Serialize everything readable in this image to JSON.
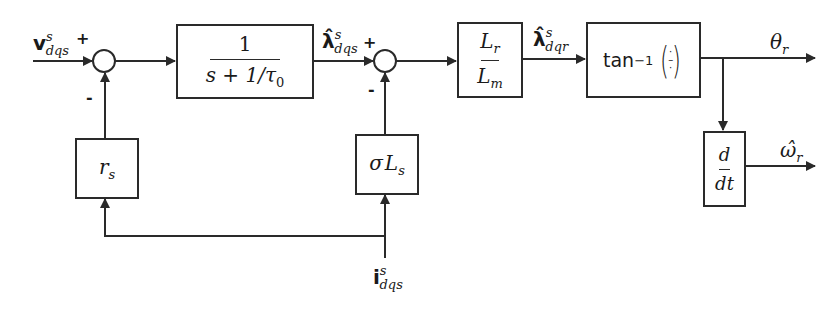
{
  "diagram": {
    "title": "",
    "type": "block-diagram",
    "inputs": {
      "voltage": {
        "symbol": "v",
        "sup": "s",
        "sub": "dqs",
        "sign": "+"
      },
      "current": {
        "symbol": "i",
        "sup": "s",
        "sub": "dqs"
      }
    },
    "summers": [
      {
        "id": "sum1",
        "plus_sign": "+",
        "minus_sign": "-"
      },
      {
        "id": "sum2",
        "plus_sign": "+",
        "minus_sign": "-"
      }
    ],
    "blocks": {
      "integrator": {
        "numerator": "1",
        "denominator_s": "s + 1/",
        "denominator_tau": "τ",
        "denominator_tau_sub": "0"
      },
      "flux_ratio": {
        "numerator": "L",
        "numerator_sub": "r",
        "denominator": "L",
        "denominator_sub": "m"
      },
      "arctan": {
        "label": "tan",
        "exponent": "−1",
        "arg_top": "·",
        "arg_mid": "–",
        "arg_bot": "·"
      },
      "derivative": {
        "numerator": "d",
        "denominator": "dt"
      },
      "stator_resistance": {
        "symbol": "r",
        "sub": "s"
      },
      "leakage_inductance": {
        "sigma": "σ",
        "symbol": "L",
        "sub": "s"
      }
    },
    "signals": {
      "stator_flux_est": {
        "symbol": "λ̂",
        "sup": "s",
        "sub": "dqs"
      },
      "rotor_flux_est": {
        "symbol": "λ̂",
        "sup": "s",
        "sub": "dqr"
      },
      "theta": {
        "symbol": "θ",
        "sub": "r"
      },
      "omega": {
        "symbol": "ω̂",
        "sub": "r"
      }
    },
    "colors": {
      "line": "#2a2a2a",
      "background": "#ffffff"
    }
  }
}
